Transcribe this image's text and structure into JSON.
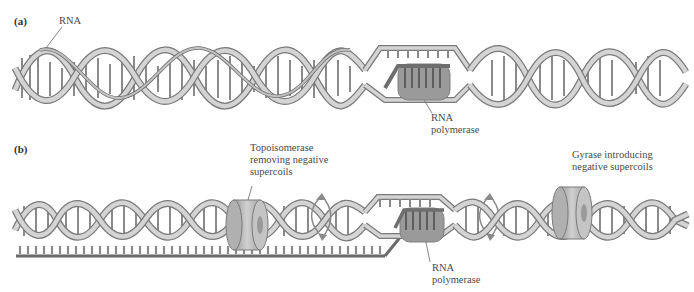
{
  "figure": {
    "panels": [
      {
        "id": "a",
        "label": "(a)",
        "annotations": {
          "rna": "RNA",
          "polymerase": [
            "RNA",
            "polymerase"
          ]
        }
      },
      {
        "id": "b",
        "label": "(b)",
        "annotations": {
          "polymerase": [
            "RNA",
            "polymerase"
          ],
          "topoisomerase": [
            "Topoisomerase",
            "removing negative",
            "supercoils"
          ],
          "gyrase": [
            "Gyrase introducing",
            "negative supercoils"
          ]
        }
      }
    ],
    "colors": {
      "strand": "#c8c8c8",
      "strand_edge": "#7a7a7a",
      "polymerase": "#9a9a9a",
      "enzyme_ring": "#bdbdbd",
      "rotation_arrow": "#8a8a8a",
      "text": "#4a4a4a"
    }
  }
}
